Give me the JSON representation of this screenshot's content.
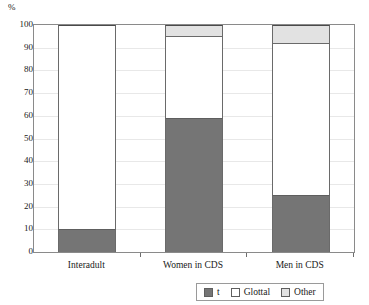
{
  "chart_data": {
    "type": "bar",
    "subtype": "stacked-100-percent",
    "title": "",
    "xlabel": "",
    "ylabel": "%",
    "ylim": [
      0,
      100
    ],
    "ytick_step": 10,
    "yticks": [
      100,
      90,
      80,
      70,
      60,
      50,
      40,
      30,
      20,
      10,
      0
    ],
    "grid": true,
    "grid_axis": "y",
    "legend_position": "bottom-right",
    "categories": [
      "Interadult",
      "Women in CDS",
      "Men in CDS"
    ],
    "series": [
      {
        "name": "t",
        "color": "#757575",
        "values": [
          10,
          59,
          25
        ]
      },
      {
        "name": "Glottal",
        "color": "#ffffff",
        "values": [
          90,
          36,
          67
        ]
      },
      {
        "name": "Other",
        "color": "#e2e2e2",
        "values": [
          0,
          5,
          8
        ]
      }
    ]
  },
  "axis": {
    "unit_label": "%"
  },
  "legend": {
    "items": [
      {
        "label": "t",
        "color": "#757575"
      },
      {
        "label": "Glottal",
        "color": "#ffffff"
      },
      {
        "label": "Other",
        "color": "#e2e2e2"
      }
    ]
  }
}
